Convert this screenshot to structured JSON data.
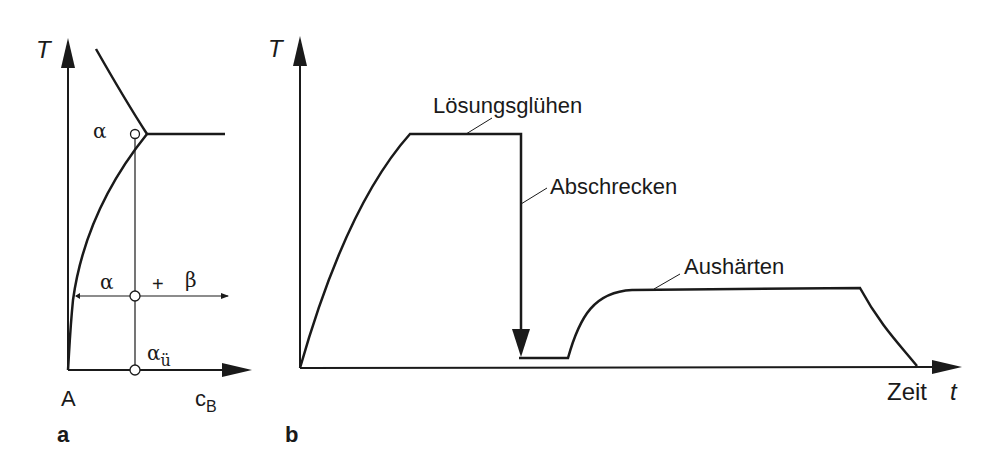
{
  "panel_a": {
    "panel_label": "a",
    "y_axis_label": "T",
    "origin_label": "A",
    "x_axis_label_main": "c",
    "x_axis_label_sub": "B",
    "region_alpha_top": "α",
    "region_alpha_left": "α",
    "region_plus": "+",
    "region_beta": "β",
    "supersaturated_main": "α",
    "supersaturated_sub": "ü"
  },
  "panel_b": {
    "panel_label": "b",
    "y_axis_label": "T",
    "x_axis_label": "Zeit",
    "x_axis_var": "t",
    "step_solution": "Lösungsglühen",
    "step_quench": "Abschrecken",
    "step_age": "Aushärten"
  },
  "colors": {
    "ink": "#1a1a1a",
    "background": "#ffffff"
  }
}
